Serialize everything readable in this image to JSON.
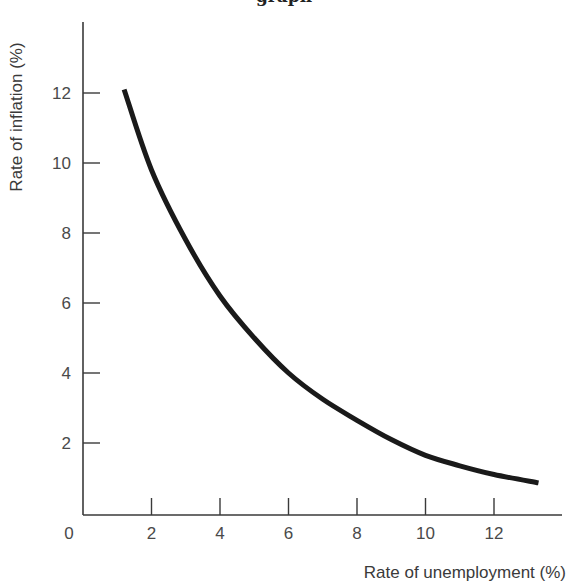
{
  "figure": {
    "clipped_caption": "graph"
  },
  "chart_data": {
    "type": "line",
    "title": "",
    "xlabel": "Rate of unemployment (%)",
    "ylabel": "Rate of inflation (%)",
    "xlim": [
      0,
      14
    ],
    "ylim": [
      0,
      14
    ],
    "grid": false,
    "legend": null,
    "x_ticks": [
      0,
      2,
      4,
      6,
      8,
      10,
      12
    ],
    "y_ticks": [
      2,
      4,
      6,
      8,
      10,
      12
    ],
    "x_tick_labels": [
      "0",
      "2",
      "4",
      "6",
      "8",
      "10",
      "12"
    ],
    "y_tick_labels": [
      "2",
      "4",
      "6",
      "8",
      "10",
      "12"
    ],
    "series": [
      {
        "name": "Phillips curve",
        "x": [
          1.2,
          2,
          3,
          4,
          5,
          6,
          7,
          8,
          9,
          10,
          11,
          12,
          13.3
        ],
        "y": [
          12.1,
          9.8,
          7.8,
          6.2,
          5.0,
          4.0,
          3.25,
          2.65,
          2.1,
          1.65,
          1.35,
          1.1,
          0.86
        ],
        "color": "#1a1a1a"
      }
    ]
  },
  "colors": {
    "axis": "#3a3a3a",
    "curve": "#1a1a1a",
    "background": "#ffffff"
  }
}
